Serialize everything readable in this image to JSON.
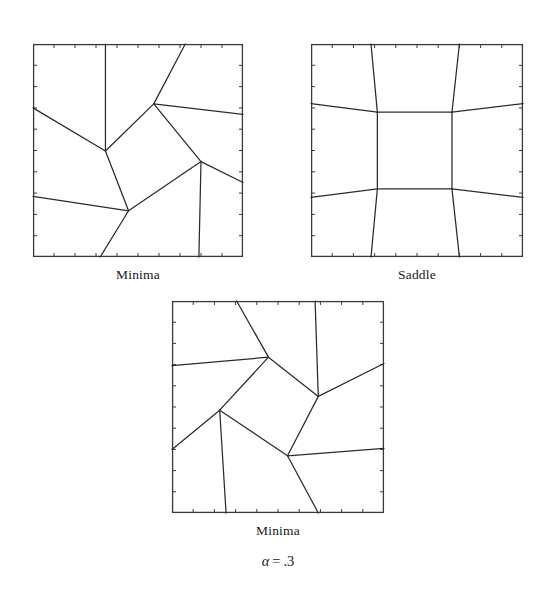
{
  "figure": {
    "background_color": "#ffffff",
    "line_color": "#2b2b2b",
    "frame_color": "#3a3a3a",
    "annotation": {
      "variable": "α",
      "equals": "=",
      "value": ".3",
      "full_text": "α = .3"
    }
  },
  "panels": [
    {
      "id": "panel-minima-top-left",
      "caption": "Minima",
      "frame": {
        "x": 33,
        "y": 44,
        "width": 210,
        "height": 213
      },
      "ticks": {
        "count_x": 10,
        "count_y": 10,
        "length": 4,
        "side": "inside"
      },
      "nodes": [
        {
          "name": "n-upper",
          "x": 0.575,
          "y": 0.281
        },
        {
          "name": "n-left-mid",
          "x": 0.345,
          "y": 0.502
        },
        {
          "name": "n-right-mid",
          "x": 0.8,
          "y": 0.552
        },
        {
          "name": "n-lower-left",
          "x": 0.455,
          "y": 0.783
        }
      ],
      "edges": [
        {
          "name": "e-top-to-upper",
          "points": [
            [
              0.725,
              0.0
            ],
            [
              0.575,
              0.281
            ]
          ]
        },
        {
          "name": "e-upper-to-right-border",
          "points": [
            [
              0.575,
              0.281
            ],
            [
              1.0,
              0.33
            ]
          ]
        },
        {
          "name": "e-upper-to-left-mid",
          "points": [
            [
              0.575,
              0.281
            ],
            [
              0.345,
              0.502
            ]
          ]
        },
        {
          "name": "e-upper-to-right-mid",
          "points": [
            [
              0.575,
              0.281
            ],
            [
              0.8,
              0.552
            ]
          ]
        },
        {
          "name": "e-left-mid-to-top",
          "points": [
            [
              0.345,
              0.502
            ],
            [
              0.345,
              0.0
            ]
          ]
        },
        {
          "name": "e-left-mid-to-left-border",
          "points": [
            [
              0.345,
              0.502
            ],
            [
              0.0,
              0.3
            ]
          ]
        },
        {
          "name": "e-left-mid-to-lower-left",
          "points": [
            [
              0.345,
              0.502
            ],
            [
              0.455,
              0.783
            ]
          ]
        },
        {
          "name": "e-lower-left-to-left-border",
          "points": [
            [
              0.455,
              0.783
            ],
            [
              0.0,
              0.715
            ]
          ]
        },
        {
          "name": "e-lower-left-to-right-mid",
          "points": [
            [
              0.455,
              0.783
            ],
            [
              0.8,
              0.552
            ]
          ]
        },
        {
          "name": "e-lower-left-to-bottom",
          "points": [
            [
              0.455,
              0.783
            ],
            [
              0.32,
              1.0
            ]
          ]
        },
        {
          "name": "e-right-mid-to-right-border",
          "points": [
            [
              0.8,
              0.552
            ],
            [
              1.0,
              0.65
            ]
          ]
        },
        {
          "name": "e-right-mid-to-bottom",
          "points": [
            [
              0.8,
              0.552
            ],
            [
              0.79,
              1.0
            ]
          ]
        }
      ]
    },
    {
      "id": "panel-saddle-top-right",
      "caption": "Saddle",
      "frame": {
        "x": 311,
        "y": 44,
        "width": 212,
        "height": 213
      },
      "ticks": {
        "count_x": 10,
        "count_y": 10,
        "length": 4,
        "side": "inside"
      },
      "nodes": [
        {
          "name": "n-top-left",
          "x": 0.313,
          "y": 0.32
        },
        {
          "name": "n-top-right",
          "x": 0.665,
          "y": 0.32
        },
        {
          "name": "n-bottom-left",
          "x": 0.313,
          "y": 0.68
        },
        {
          "name": "n-bottom-right",
          "x": 0.665,
          "y": 0.68
        }
      ],
      "edges": [
        {
          "name": "e-center-top",
          "points": [
            [
              0.313,
              0.32
            ],
            [
              0.665,
              0.32
            ]
          ]
        },
        {
          "name": "e-center-bottom",
          "points": [
            [
              0.313,
              0.68
            ],
            [
              0.665,
              0.68
            ]
          ]
        },
        {
          "name": "e-center-left",
          "points": [
            [
              0.313,
              0.32
            ],
            [
              0.313,
              0.68
            ]
          ]
        },
        {
          "name": "e-center-right",
          "points": [
            [
              0.665,
              0.32
            ],
            [
              0.665,
              0.68
            ]
          ]
        },
        {
          "name": "e-tl-up",
          "points": [
            [
              0.313,
              0.32
            ],
            [
              0.283,
              0.0
            ]
          ]
        },
        {
          "name": "e-tr-up",
          "points": [
            [
              0.665,
              0.32
            ],
            [
              0.7,
              0.0
            ]
          ]
        },
        {
          "name": "e-bl-down",
          "points": [
            [
              0.313,
              0.68
            ],
            [
              0.283,
              1.0
            ]
          ]
        },
        {
          "name": "e-br-down",
          "points": [
            [
              0.665,
              0.68
            ],
            [
              0.7,
              1.0
            ]
          ]
        },
        {
          "name": "e-tl-left",
          "points": [
            [
              0.313,
              0.32
            ],
            [
              0.0,
              0.28
            ]
          ]
        },
        {
          "name": "e-bl-left",
          "points": [
            [
              0.313,
              0.68
            ],
            [
              0.0,
              0.72
            ]
          ]
        },
        {
          "name": "e-tr-right",
          "points": [
            [
              0.665,
              0.32
            ],
            [
              1.0,
              0.28
            ]
          ]
        },
        {
          "name": "e-br-right",
          "points": [
            [
              0.665,
              0.68
            ],
            [
              1.0,
              0.72
            ]
          ]
        }
      ]
    },
    {
      "id": "panel-minima-bottom",
      "caption": "Minima",
      "frame": {
        "x": 172,
        "y": 301,
        "width": 212,
        "height": 212
      },
      "ticks": {
        "count_x": 10,
        "count_y": 10,
        "length": 4,
        "side": "inside"
      },
      "nodes": [
        {
          "name": "n-upper",
          "x": 0.455,
          "y": 0.265
        },
        {
          "name": "n-right-mid",
          "x": 0.69,
          "y": 0.45
        },
        {
          "name": "n-left-mid",
          "x": 0.225,
          "y": 0.515
        },
        {
          "name": "n-lower-right",
          "x": 0.545,
          "y": 0.73
        }
      ],
      "edges": [
        {
          "name": "e-upper-to-top",
          "points": [
            [
              0.455,
              0.265
            ],
            [
              0.305,
              0.0
            ]
          ]
        },
        {
          "name": "e-upper-to-left-border",
          "points": [
            [
              0.455,
              0.265
            ],
            [
              0.0,
              0.305
            ]
          ]
        },
        {
          "name": "e-upper-to-right-mid",
          "points": [
            [
              0.455,
              0.265
            ],
            [
              0.69,
              0.45
            ]
          ]
        },
        {
          "name": "e-upper-to-left-mid",
          "points": [
            [
              0.455,
              0.265
            ],
            [
              0.225,
              0.515
            ]
          ]
        },
        {
          "name": "e-right-mid-to-top",
          "points": [
            [
              0.69,
              0.45
            ],
            [
              0.675,
              0.0
            ]
          ]
        },
        {
          "name": "e-right-mid-to-right-border",
          "points": [
            [
              0.69,
              0.45
            ],
            [
              1.0,
              0.295
            ]
          ]
        },
        {
          "name": "e-right-mid-to-lower-right",
          "points": [
            [
              0.69,
              0.45
            ],
            [
              0.545,
              0.73
            ]
          ]
        },
        {
          "name": "e-left-mid-to-left-border",
          "points": [
            [
              0.225,
              0.515
            ],
            [
              0.0,
              0.7
            ]
          ]
        },
        {
          "name": "e-left-mid-to-lower-right",
          "points": [
            [
              0.225,
              0.515
            ],
            [
              0.545,
              0.73
            ]
          ]
        },
        {
          "name": "e-left-mid-to-bottom",
          "points": [
            [
              0.225,
              0.515
            ],
            [
              0.255,
              1.0
            ]
          ]
        },
        {
          "name": "e-lower-right-to-right-border",
          "points": [
            [
              0.545,
              0.73
            ],
            [
              1.0,
              0.695
            ]
          ]
        },
        {
          "name": "e-lower-right-to-bottom",
          "points": [
            [
              0.545,
              0.73
            ],
            [
              0.69,
              1.0
            ]
          ]
        }
      ]
    }
  ]
}
